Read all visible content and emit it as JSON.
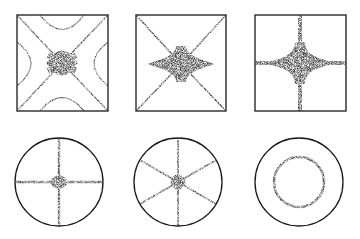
{
  "figure": {
    "title": "",
    "colors": {
      "outline": "#1a1a1a",
      "sand": "#555555",
      "background": "#ffffff"
    },
    "panels": [
      {
        "id": "square-1",
        "shape": "square",
        "pattern": "diagonal-cross-with-hyperbolas",
        "x": 17,
        "y": 15,
        "size": 91
      },
      {
        "id": "square-2",
        "shape": "square",
        "pattern": "diagonal-cross",
        "x": 136,
        "y": 15,
        "size": 90
      },
      {
        "id": "square-3",
        "shape": "square",
        "pattern": "orthogonal-cross",
        "x": 255,
        "y": 15,
        "size": 91
      },
      {
        "id": "circle-1",
        "shape": "circle",
        "pattern": "two-diameters",
        "cx": 59,
        "cy": 182,
        "r": 44
      },
      {
        "id": "circle-2",
        "shape": "circle",
        "pattern": "three-diameters",
        "cx": 178,
        "cy": 182,
        "r": 44
      },
      {
        "id": "circle-3",
        "shape": "circle",
        "pattern": "concentric-ring",
        "cx": 299,
        "cy": 182,
        "r": 44,
        "inner_r": 25
      }
    ]
  }
}
